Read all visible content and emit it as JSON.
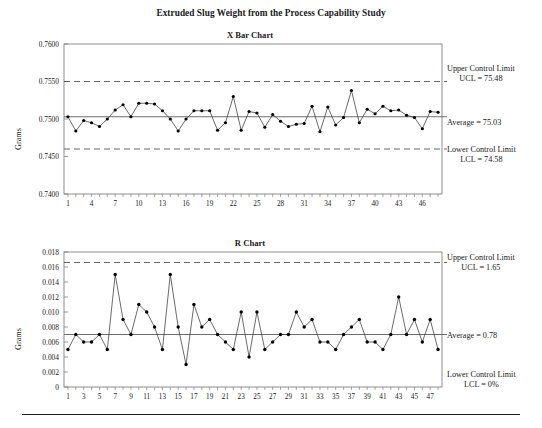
{
  "figure": {
    "title": "Extruded Slug Weight from the Process Capability Study"
  },
  "rule": {
    "present": true
  },
  "charts": {
    "xbar": {
      "title": "X Bar Chart",
      "ylabel": "Grams",
      "annotations": {
        "ucl_line1": "Upper Control Limit",
        "ucl_line2": "UCL = 75.48",
        "average": "Average = 75.03",
        "lcl_line1": "Lower Control Limit",
        "lcl_line2": "LCL = 74.58"
      }
    },
    "r": {
      "title": "R Chart",
      "ylabel": "Grams",
      "annotations": {
        "ucl_line1": "Upper Control Limit",
        "ucl_line2": "UCL = 1.65",
        "average": "Average = 0.78",
        "lcl_line1": "Lower Control Limit",
        "lcl_line2": "LCL = 0%"
      }
    }
  },
  "chart_data": [
    {
      "type": "line",
      "name": "x-bar-chart",
      "title": "X Bar Chart",
      "xlabel": "",
      "ylabel": "Grams",
      "ylim": [
        0.74,
        0.76
      ],
      "yticks": [
        0.74,
        0.745,
        0.75,
        0.755,
        0.76
      ],
      "ytick_labels": [
        "0.7400",
        "0.7450",
        "0.7500",
        "0.7550",
        "0.7600"
      ],
      "xlim": [
        0.5,
        48.5
      ],
      "xticks": [
        1,
        4,
        7,
        10,
        13,
        16,
        19,
        22,
        25,
        28,
        31,
        34,
        37,
        40,
        43,
        46
      ],
      "xtick_labels": [
        "1",
        "4",
        "7",
        "10",
        "13",
        "16",
        "19",
        "22",
        "25",
        "28",
        "31",
        "34",
        "37",
        "40",
        "43",
        "46"
      ],
      "x": [
        1,
        2,
        3,
        4,
        5,
        6,
        7,
        8,
        9,
        10,
        11,
        12,
        13,
        14,
        15,
        16,
        17,
        18,
        19,
        20,
        21,
        22,
        23,
        24,
        25,
        26,
        27,
        28,
        29,
        30,
        31,
        32,
        33,
        34,
        35,
        36,
        37,
        38,
        39,
        40,
        41,
        42,
        43,
        44,
        45,
        46,
        47,
        48
      ],
      "values": [
        0.7503,
        0.7484,
        0.7498,
        0.7495,
        0.749,
        0.75,
        0.7512,
        0.7519,
        0.7503,
        0.7521,
        0.7521,
        0.752,
        0.7511,
        0.75,
        0.7484,
        0.75,
        0.7511,
        0.7511,
        0.7511,
        0.7485,
        0.7495,
        0.753,
        0.7485,
        0.751,
        0.7508,
        0.7489,
        0.7506,
        0.7497,
        0.749,
        0.7493,
        0.7494,
        0.7517,
        0.7483,
        0.7516,
        0.7492,
        0.7502,
        0.7538,
        0.7495,
        0.7513,
        0.7507,
        0.7517,
        0.7511,
        0.7512,
        0.7505,
        0.7502,
        0.7487,
        0.751,
        0.7509
      ],
      "control_lines": {
        "ucl": 0.755,
        "center": 0.7503,
        "lcl": 0.746
      },
      "grid": false,
      "legend": "none"
    },
    {
      "type": "line",
      "name": "r-chart",
      "title": "R Chart",
      "xlabel": "",
      "ylabel": "Grams",
      "ylim": [
        0,
        0.018
      ],
      "yticks": [
        0,
        0.002,
        0.004,
        0.006,
        0.008,
        0.01,
        0.012,
        0.014,
        0.016,
        0.018
      ],
      "ytick_labels": [
        "0",
        "0.002",
        "0.004",
        "0.006",
        "0.008",
        "0.010",
        "0.012",
        "0.014",
        "0.016",
        "0.018"
      ],
      "xlim": [
        0.5,
        48.5
      ],
      "xticks": [
        1,
        3,
        5,
        7,
        9,
        11,
        13,
        15,
        17,
        19,
        21,
        23,
        25,
        27,
        29,
        31,
        33,
        35,
        37,
        39,
        41,
        43,
        45,
        47
      ],
      "xtick_labels": [
        "1",
        "3",
        "5",
        "7",
        "9",
        "11",
        "13",
        "15",
        "17",
        "19",
        "21",
        "23",
        "25",
        "27",
        "29",
        "31",
        "33",
        "35",
        "37",
        "39",
        "41",
        "43",
        "45",
        "47"
      ],
      "x": [
        1,
        2,
        3,
        4,
        5,
        6,
        7,
        8,
        9,
        10,
        11,
        12,
        13,
        14,
        15,
        16,
        17,
        18,
        19,
        20,
        21,
        22,
        23,
        24,
        25,
        26,
        27,
        28,
        29,
        30,
        31,
        32,
        33,
        34,
        35,
        36,
        37,
        38,
        39,
        40,
        41,
        42,
        43,
        44,
        45,
        46,
        47,
        48
      ],
      "values": [
        0.005,
        0.007,
        0.006,
        0.006,
        0.007,
        0.005,
        0.015,
        0.009,
        0.007,
        0.011,
        0.01,
        0.008,
        0.005,
        0.015,
        0.008,
        0.003,
        0.011,
        0.008,
        0.009,
        0.007,
        0.006,
        0.005,
        0.01,
        0.004,
        0.01,
        0.005,
        0.006,
        0.007,
        0.007,
        0.01,
        0.008,
        0.009,
        0.006,
        0.006,
        0.005,
        0.007,
        0.008,
        0.009,
        0.006,
        0.006,
        0.005,
        0.007,
        0.012,
        0.007,
        0.009,
        0.006,
        0.009,
        0.005
      ],
      "control_lines": {
        "ucl": 0.0166,
        "center": 0.007,
        "lcl": 0
      },
      "grid": false,
      "legend": "none"
    }
  ],
  "colors": {
    "line": "#3a3a3a",
    "marker": "#000000",
    "axis": "#808080",
    "control_dash": "#555555",
    "center_line": "#6e6e6e",
    "text": "#1a1a1a"
  }
}
